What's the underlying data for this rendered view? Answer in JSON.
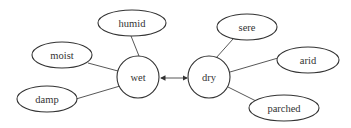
{
  "diagram": {
    "type": "semantic-network",
    "colors": {
      "stroke": "#333333",
      "background": "#ffffff",
      "text": "#333333"
    },
    "hubs": [
      {
        "id": "wet",
        "label": "wet",
        "cx": 138,
        "cy": 77,
        "r": 21
      },
      {
        "id": "dry",
        "label": "dry",
        "cx": 209,
        "cy": 77,
        "r": 21
      }
    ],
    "leaves": [
      {
        "id": "humid",
        "label": "humid",
        "cx": 132,
        "cy": 23,
        "rx": 34,
        "ry": 13,
        "hub": "wet"
      },
      {
        "id": "moist",
        "label": "moist",
        "cx": 62,
        "cy": 55,
        "rx": 30,
        "ry": 13,
        "hub": "wet"
      },
      {
        "id": "damp",
        "label": "damp",
        "cx": 47,
        "cy": 99,
        "rx": 30,
        "ry": 13,
        "hub": "wet"
      },
      {
        "id": "sere",
        "label": "sere",
        "cx": 247,
        "cy": 27,
        "rx": 30,
        "ry": 13,
        "hub": "dry"
      },
      {
        "id": "arid",
        "label": "arid",
        "cx": 308,
        "cy": 60,
        "rx": 31,
        "ry": 13,
        "hub": "dry"
      },
      {
        "id": "parched",
        "label": "parched",
        "cx": 284,
        "cy": 108,
        "rx": 35,
        "ry": 13,
        "hub": "dry"
      }
    ],
    "relation": {
      "from": "wet",
      "to": "dry",
      "kind": "antonym",
      "arrow": "double-headed"
    }
  }
}
